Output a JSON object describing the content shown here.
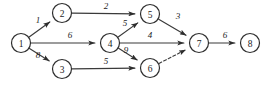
{
  "diagram": {
    "type": "directed-weighted-graph",
    "title": "",
    "width": 274,
    "height": 89,
    "background_color": "#ffffff",
    "node_radius": 9.5,
    "node_stroke_color": "#2e2e2e",
    "edge_color": "#3a3a3a",
    "text_color": "#1c1c1c",
    "nodes": [
      {
        "id": "1",
        "label": "1",
        "x": 21,
        "y": 43
      },
      {
        "id": "2",
        "label": "2",
        "x": 62,
        "y": 13
      },
      {
        "id": "3",
        "label": "3",
        "x": 62,
        "y": 69
      },
      {
        "id": "4",
        "label": "4",
        "x": 110,
        "y": 43
      },
      {
        "id": "5",
        "label": "5",
        "x": 150,
        "y": 14
      },
      {
        "id": "6",
        "label": "6",
        "x": 150,
        "y": 68
      },
      {
        "id": "7",
        "label": "7",
        "x": 199,
        "y": 43
      },
      {
        "id": "8",
        "label": "8",
        "x": 250,
        "y": 43
      }
    ],
    "edges": [
      {
        "from": "1",
        "to": "2",
        "weight": "1",
        "style": "solid",
        "label_x": 38,
        "label_y": 20
      },
      {
        "from": "1",
        "to": "4",
        "weight": "6",
        "style": "solid",
        "label_x": 70,
        "label_y": 35
      },
      {
        "from": "1",
        "to": "3",
        "weight": "8",
        "style": "solid",
        "label_x": 38,
        "label_y": 55
      },
      {
        "from": "2",
        "to": "5",
        "weight": "2",
        "style": "solid",
        "label_x": 106,
        "label_y": 6
      },
      {
        "from": "3",
        "to": "6",
        "weight": "5",
        "style": "solid",
        "label_x": 106,
        "label_y": 61
      },
      {
        "from": "4",
        "to": "5",
        "weight": "5",
        "style": "solid",
        "label_x": 125,
        "label_y": 23
      },
      {
        "from": "4",
        "to": "7",
        "weight": "4",
        "style": "solid",
        "label_x": 150,
        "label_y": 35
      },
      {
        "from": "4",
        "to": "6",
        "weight": "9",
        "style": "solid",
        "label_x": 126,
        "label_y": 50
      },
      {
        "from": "5",
        "to": "7",
        "weight": "3",
        "style": "solid",
        "label_x": 178,
        "label_y": 16
      },
      {
        "from": "6",
        "to": "7",
        "weight": "",
        "style": "dashed",
        "label_x": 176,
        "label_y": 60
      },
      {
        "from": "7",
        "to": "8",
        "weight": "6",
        "style": "solid",
        "label_x": 225,
        "label_y": 35
      }
    ]
  }
}
